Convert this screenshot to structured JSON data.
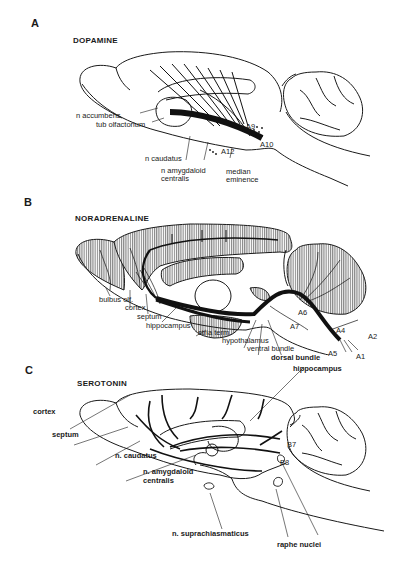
{
  "figure": {
    "panels": [
      {
        "letter": "A",
        "title": "DOPAMINE",
        "labels": {
          "accumbens": "n accumbens",
          "tub_olf": "tub olfactorium",
          "caudatus": "n caudatus",
          "amygdaloid_1": "n amygdaloid",
          "amygdaloid_2": "centralis",
          "a12": "A12",
          "median_1": "median",
          "median_2": "eminence",
          "a9": "A9",
          "a10": "A10"
        }
      },
      {
        "letter": "B",
        "title": "NORADRENALINE",
        "labels": {
          "bulbus": "bulbus olf.",
          "cortex": "cortex",
          "septum": "septum",
          "hippocampus": "hippocampus",
          "stria": "stria term.",
          "hypothalamus": "hypothalamus",
          "ventral": "ventral bundle",
          "dorsal": "dorsal bundle",
          "a6": "A6",
          "a7": "A7",
          "a4": "A4",
          "a2": "A2",
          "a5": "A5",
          "a1": "A1"
        }
      },
      {
        "letter": "C",
        "title": "SEROTONIN",
        "labels": {
          "hippocampus": "hippocampus",
          "cortex": "cortex",
          "septum": "septum",
          "caudatus": "n. caudatus",
          "amygdaloid_1": "n. amygdaloid",
          "amygdaloid_2": "centralis",
          "suprachiasmaticus": "n. suprachiasmaticus",
          "b7": "B7",
          "b8": "B8",
          "raphe": "raphe nuclei"
        }
      }
    ],
    "caption_fragment": ""
  },
  "colors": {
    "ink": "#1a1a1a",
    "hatch": "#555555",
    "background": "#ffffff"
  }
}
